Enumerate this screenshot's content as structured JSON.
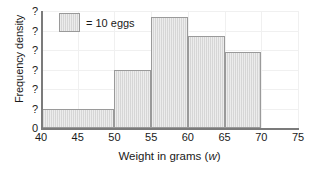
{
  "chart_data": {
    "type": "bar",
    "title": "",
    "subtitle": "",
    "xlabel_prefix": "Weight in grams (",
    "xlabel_variable": "w",
    "xlabel_suffix": ")",
    "ylabel": "Frequency density",
    "grid": true,
    "legend_position": "top-left",
    "xlim": [
      40,
      75
    ],
    "ylim": [
      0,
      6
    ],
    "x_ticks": [
      40,
      45,
      50,
      55,
      60,
      65,
      70,
      75
    ],
    "x_tick_labels": [
      "40",
      "45",
      "50",
      "55",
      "60",
      "65",
      "70",
      "75"
    ],
    "y_ticks": [
      0,
      1,
      2,
      3,
      4,
      5,
      6
    ],
    "y_tick_labels": [
      "0",
      "?",
      "?",
      "?",
      "?",
      "?",
      "?"
    ],
    "bins": [
      {
        "label": "40-50",
        "x_start": 40,
        "x_end": 50,
        "frequency_density": 1.0
      },
      {
        "label": "50-55",
        "x_start": 50,
        "x_end": 55,
        "frequency_density": 3.0
      },
      {
        "label": "55-60",
        "x_start": 55,
        "x_end": 60,
        "frequency_density": 5.7
      },
      {
        "label": "60-65",
        "x_start": 60,
        "x_end": 65,
        "frequency_density": 4.7
      },
      {
        "label": "65-70",
        "x_start": 65,
        "x_end": 70,
        "frequency_density": 3.9
      }
    ],
    "legend": {
      "swatch_name": "hatched-grey-square",
      "label": "= 10 eggs"
    },
    "colors": {
      "bar_fill": "#d6d6d6",
      "bar_border": "#9a9a9a",
      "axis": "#7b7b7b",
      "gridline": "#f0f0f0",
      "text": "#1a1a1a"
    }
  }
}
